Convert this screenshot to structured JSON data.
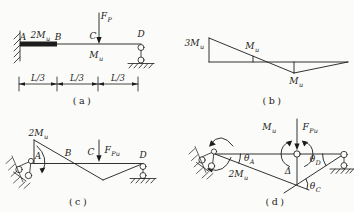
{
  "colors": {
    "ink": "#1c1c1c",
    "paper": "#fbfbf9"
  },
  "figures": {
    "a": {
      "caption": "(a)",
      "point_A": "A",
      "point_B": "B",
      "point_C": "C",
      "point_D": "D",
      "moment_AB": {
        "base": "2M",
        "sub": "u"
      },
      "moment_C": {
        "base": "M",
        "sub": "u"
      },
      "force_P": {
        "base": "F",
        "sub": "P"
      },
      "dims": [
        "L/3",
        "L/3",
        "L/3"
      ]
    },
    "b": {
      "caption": "(b)",
      "moment_left": {
        "base": "3M",
        "sub": "u"
      },
      "moment_mid": {
        "base": "M",
        "sub": "u"
      },
      "moment_min": {
        "base": "M",
        "sub": "u"
      }
    },
    "c": {
      "caption": "(c)",
      "point_A": "A",
      "point_B": "B",
      "point_C": "C",
      "point_D": "D",
      "moment_A": {
        "base": "2M",
        "sub": "u"
      },
      "force_Pu": {
        "base": "F",
        "sub": "Pu"
      }
    },
    "d": {
      "caption": "(d)",
      "moment_C": {
        "base": "M",
        "sub": "u"
      },
      "moment_A": {
        "base": "2M",
        "sub": "u"
      },
      "force_Pu": {
        "base": "F",
        "sub": "Pu"
      },
      "theta_A": {
        "base": "θ",
        "sub": "A"
      },
      "theta_C": {
        "base": "θ",
        "sub": "C"
      },
      "theta_D": {
        "base": "θ",
        "sub": "D"
      },
      "delta": "Δ"
    }
  }
}
